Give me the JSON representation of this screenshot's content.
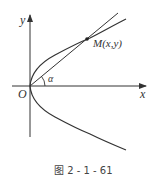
{
  "figure": {
    "caption": "图 2 - 1 - 61",
    "labels": {
      "y_axis": "y",
      "x_axis": "x",
      "origin": "O",
      "point": "M(x,y)",
      "angle": "α"
    }
  },
  "colors": {
    "stroke": "#333333",
    "text": "#333333",
    "background": "#ffffff"
  }
}
